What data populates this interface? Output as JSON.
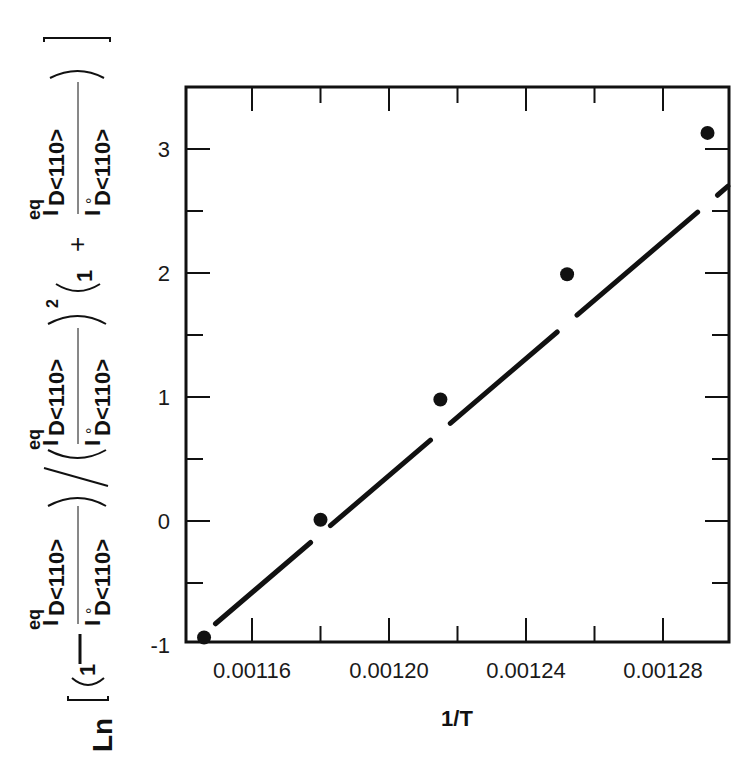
{
  "chart_data": {
    "type": "scatter",
    "title": "",
    "xlabel": "1/T",
    "ylabel": "Ln [ (1 − I^eq_D<110> / I°_D<110>) / ( I^eq_D<110> / I°_D<110> )² ( 1 + I^eq_D<110> / I°_D<110> ) ]",
    "xlim": [
      0.001142,
      0.001324
    ],
    "ylim": [
      -1,
      3.5
    ],
    "x_ticks_major": [
      0.00116,
      0.0012,
      0.00124,
      0.00128
    ],
    "x_tick_labels": [
      "0.00116",
      "0.00120",
      "0.00124",
      "0.00128"
    ],
    "x_ticks_minor": [
      0.00118,
      0.00122,
      0.00126
    ],
    "y_ticks_major": [
      -1,
      0,
      1,
      2,
      3
    ],
    "y_tick_labels": [
      "-1",
      "0",
      "1",
      "2",
      "3"
    ],
    "y_ticks_minor": [
      -0.5,
      0.5,
      1.5,
      2.5
    ],
    "grid": false,
    "legend": null,
    "series": [
      {
        "name": "data",
        "marker": "filled-circle",
        "x": [
          0.001146,
          0.00118,
          0.001215,
          0.001252,
          0.001293
        ],
        "y": [
          -0.94,
          0.01,
          0.98,
          1.99,
          3.13
        ]
      },
      {
        "name": "linear fit",
        "style": "solid-line-broken-at-points",
        "x": [
          0.001148,
          0.001324
        ],
        "y": [
          -0.86,
          3.29
        ]
      }
    ]
  },
  "labels": {
    "xlabel": "1/T",
    "ylabel": {
      "ln": "Ln",
      "one": "1",
      "minus": "—",
      "plus": "+",
      "I": "I",
      "eq": "eq",
      "zero": "°",
      "sub": "D<110>",
      "square": "2",
      "slash": "/"
    }
  }
}
